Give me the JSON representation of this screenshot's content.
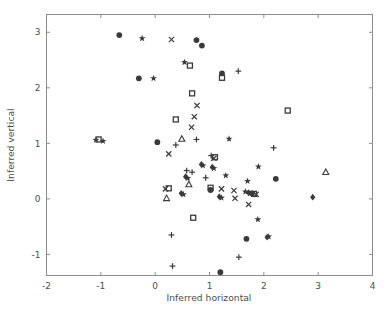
{
  "figure": {
    "background_color": "#ffffff",
    "axes_color": "#8c8c8c",
    "marker_color": "#3a3a3a",
    "width": 391,
    "height": 314
  },
  "chart_data": {
    "type": "scatter",
    "title": "",
    "xlabel": "Inferred horizontal",
    "ylabel": "Inferred vertical",
    "xlim": [
      -2,
      4
    ],
    "ylim": [
      -1.38,
      3.32
    ],
    "grid": false,
    "legend": null,
    "xticks": [
      -2,
      -1,
      0,
      1,
      2,
      3,
      4
    ],
    "xticklabels": [
      "-2",
      "-1",
      "0",
      "1",
      "2",
      "3",
      "4"
    ],
    "yticks": [
      -1,
      0,
      1,
      2,
      3
    ],
    "yticklabels": [
      "-1",
      "0",
      "1",
      "2",
      "3"
    ],
    "marker_shapes": [
      "circle",
      "square",
      "triangle",
      "x",
      "plus",
      "star",
      "diamond"
    ],
    "points": [
      {
        "x": -0.66,
        "y": 2.95,
        "m": "circle"
      },
      {
        "x": -0.24,
        "y": 2.89,
        "m": "star"
      },
      {
        "x": 0.3,
        "y": 2.87,
        "m": "x"
      },
      {
        "x": 0.76,
        "y": 2.86,
        "m": "circle"
      },
      {
        "x": 0.86,
        "y": 2.76,
        "m": "circle"
      },
      {
        "x": 0.54,
        "y": 2.46,
        "m": "star"
      },
      {
        "x": 0.64,
        "y": 2.4,
        "m": "square"
      },
      {
        "x": -0.3,
        "y": 2.17,
        "m": "circle"
      },
      {
        "x": -0.03,
        "y": 2.17,
        "m": "star"
      },
      {
        "x": 1.23,
        "y": 2.26,
        "m": "circle"
      },
      {
        "x": 1.23,
        "y": 2.18,
        "m": "square"
      },
      {
        "x": 1.53,
        "y": 2.3,
        "m": "plus"
      },
      {
        "x": 0.68,
        "y": 1.9,
        "m": "square"
      },
      {
        "x": 0.77,
        "y": 1.68,
        "m": "x"
      },
      {
        "x": 0.72,
        "y": 1.48,
        "m": "x"
      },
      {
        "x": 2.44,
        "y": 1.59,
        "m": "square"
      },
      {
        "x": 0.38,
        "y": 1.43,
        "m": "square"
      },
      {
        "x": 0.67,
        "y": 1.29,
        "m": "x"
      },
      {
        "x": 0.49,
        "y": 1.08,
        "m": "triangle"
      },
      {
        "x": 0.76,
        "y": 1.07,
        "m": "plus"
      },
      {
        "x": 1.36,
        "y": 1.08,
        "m": "star"
      },
      {
        "x": -1.09,
        "y": 1.06,
        "m": "star"
      },
      {
        "x": -1.04,
        "y": 1.07,
        "m": "square"
      },
      {
        "x": -0.96,
        "y": 1.04,
        "m": "star"
      },
      {
        "x": 0.04,
        "y": 1.02,
        "m": "circle"
      },
      {
        "x": 0.38,
        "y": 0.97,
        "m": "plus"
      },
      {
        "x": 0.25,
        "y": 0.81,
        "m": "x"
      },
      {
        "x": 2.18,
        "y": 0.92,
        "m": "plus"
      },
      {
        "x": 1.03,
        "y": 0.78,
        "m": "plus"
      },
      {
        "x": 1.1,
        "y": 0.75,
        "m": "square"
      },
      {
        "x": 1.08,
        "y": 0.73,
        "m": "x"
      },
      {
        "x": 0.85,
        "y": 0.62,
        "m": "diamond"
      },
      {
        "x": 0.88,
        "y": 0.6,
        "m": "star"
      },
      {
        "x": 1.05,
        "y": 0.57,
        "m": "diamond"
      },
      {
        "x": 1.08,
        "y": 0.55,
        "m": "star"
      },
      {
        "x": 1.9,
        "y": 0.58,
        "m": "star"
      },
      {
        "x": 3.14,
        "y": 0.48,
        "m": "triangle"
      },
      {
        "x": 0.58,
        "y": 0.51,
        "m": "plus"
      },
      {
        "x": 0.68,
        "y": 0.48,
        "m": "plus"
      },
      {
        "x": 0.56,
        "y": 0.4,
        "m": "diamond"
      },
      {
        "x": 0.6,
        "y": 0.37,
        "m": "star"
      },
      {
        "x": 0.93,
        "y": 0.38,
        "m": "plus"
      },
      {
        "x": 1.3,
        "y": 0.42,
        "m": "star"
      },
      {
        "x": 2.22,
        "y": 0.36,
        "m": "circle"
      },
      {
        "x": 1.7,
        "y": 0.32,
        "m": "star"
      },
      {
        "x": 0.62,
        "y": 0.26,
        "m": "triangle"
      },
      {
        "x": 0.19,
        "y": 0.18,
        "m": "x"
      },
      {
        "x": 0.25,
        "y": 0.19,
        "m": "square"
      },
      {
        "x": 1.02,
        "y": 0.2,
        "m": "square"
      },
      {
        "x": 1.02,
        "y": 0.16,
        "m": "circle"
      },
      {
        "x": 1.22,
        "y": 0.18,
        "m": "x"
      },
      {
        "x": 1.45,
        "y": 0.15,
        "m": "x"
      },
      {
        "x": 0.48,
        "y": 0.1,
        "m": "diamond"
      },
      {
        "x": 0.52,
        "y": 0.08,
        "m": "star"
      },
      {
        "x": 1.66,
        "y": 0.13,
        "m": "star"
      },
      {
        "x": 1.72,
        "y": 0.11,
        "m": "diamond"
      },
      {
        "x": 1.78,
        "y": 0.1,
        "m": "circle"
      },
      {
        "x": 1.82,
        "y": 0.09,
        "m": "square"
      },
      {
        "x": 1.86,
        "y": 0.08,
        "m": "x"
      },
      {
        "x": 0.21,
        "y": 0.01,
        "m": "triangle"
      },
      {
        "x": 1.18,
        "y": 0.04,
        "m": "diamond"
      },
      {
        "x": 1.22,
        "y": 0.02,
        "m": "star"
      },
      {
        "x": 1.47,
        "y": 0.01,
        "m": "x"
      },
      {
        "x": 2.9,
        "y": 0.03,
        "m": "diamond"
      },
      {
        "x": 1.72,
        "y": -0.1,
        "m": "x"
      },
      {
        "x": 0.7,
        "y": -0.34,
        "m": "square"
      },
      {
        "x": 1.89,
        "y": -0.37,
        "m": "star"
      },
      {
        "x": 0.3,
        "y": -0.65,
        "m": "plus"
      },
      {
        "x": 1.68,
        "y": -0.72,
        "m": "circle"
      },
      {
        "x": 2.06,
        "y": -0.69,
        "m": "diamond"
      },
      {
        "x": 2.09,
        "y": -0.68,
        "m": "star"
      },
      {
        "x": 1.54,
        "y": -1.05,
        "m": "plus"
      },
      {
        "x": 0.32,
        "y": -1.21,
        "m": "plus"
      },
      {
        "x": 1.2,
        "y": -1.32,
        "m": "circle"
      }
    ]
  }
}
